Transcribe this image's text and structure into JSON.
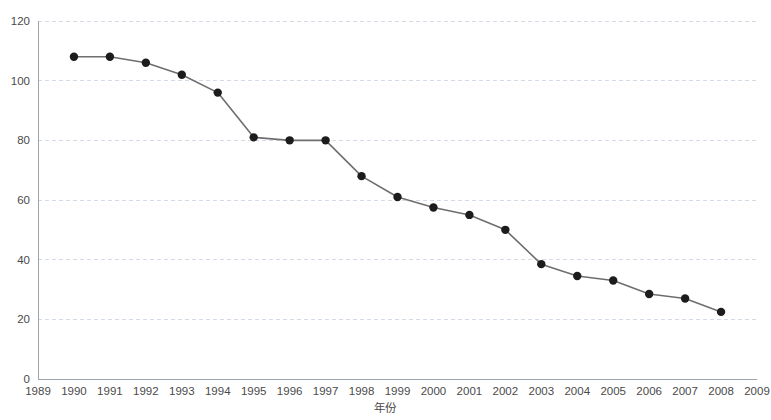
{
  "chart_data": {
    "type": "line",
    "title": "",
    "xlabel": "年份",
    "ylabel": "",
    "grid": true,
    "legend": "none",
    "xlim": [
      1989,
      2009
    ],
    "ylim": [
      0,
      120
    ],
    "ytick_labels": [
      "0",
      "20",
      "40",
      "60",
      "80",
      "100",
      "120"
    ],
    "yticks": [
      0,
      20,
      40,
      60,
      80,
      100,
      120
    ],
    "xtick_labels": [
      "1989",
      "1990",
      "1991",
      "1992",
      "1993",
      "1994",
      "1995",
      "1996",
      "1997",
      "1998",
      "1999",
      "2000",
      "2001",
      "2002",
      "2003",
      "2004",
      "2005",
      "2006",
      "2007",
      "2008",
      "2009"
    ],
    "xticks": [
      1989,
      1990,
      1991,
      1992,
      1993,
      1994,
      1995,
      1996,
      1997,
      1998,
      1999,
      2000,
      2001,
      2002,
      2003,
      2004,
      2005,
      2006,
      2007,
      2008,
      2009
    ],
    "series": [
      {
        "name": "series-1",
        "color": "#6e6e6e",
        "marker_color": "#1c1c1c",
        "x": [
          1990,
          1991,
          1992,
          1993,
          1994,
          1995,
          1996,
          1997,
          1998,
          1999,
          2000,
          2001,
          2002,
          2003,
          2004,
          2005,
          2006,
          2007,
          2008
        ],
        "values": [
          108,
          108,
          106,
          102,
          96,
          81,
          80,
          80,
          68,
          61,
          57.5,
          55,
          50,
          38.5,
          34.5,
          33,
          28.5,
          27,
          22.5
        ]
      }
    ]
  },
  "colors": {
    "background": "#ffffff",
    "grid": "#d3dbe6",
    "axis": "#9aa2ab",
    "line": "#6e6e6e",
    "marker": "#1c1c1c",
    "text": "#4a4a4a"
  }
}
